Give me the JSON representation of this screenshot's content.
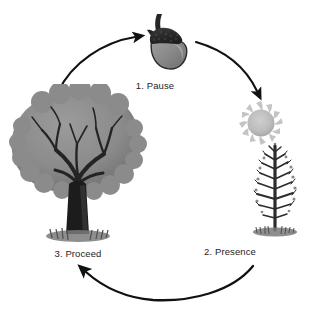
{
  "diagram": {
    "background_color": "#ffffff",
    "arrow_color": "#111111",
    "text_color": "#1d1d1d",
    "direction": "clockwise",
    "nodes": [
      {
        "id": "pause",
        "label": "1. Pause",
        "icon": "acorn-icon",
        "icon_description": "acorn with dark textured cap, stem and gray nut body",
        "colors": {
          "cap": "#2b2b2b",
          "nut": "#8a8a8a",
          "nut_highlight": "#b4b4b4",
          "stem": "#262626"
        }
      },
      {
        "id": "presence",
        "label": "2. Presence",
        "icon": "sun-and-sapling-icon",
        "icon_description": "gray sun with swirled rays above a bare young tree on grass",
        "colors": {
          "sun": "#b9b9b9",
          "sun_rays": "#c9c9c9",
          "tree": "#2a2a2a",
          "grass": "#6d6d6d"
        }
      },
      {
        "id": "proceed",
        "label": "3. Proceed",
        "icon": "mature-tree-icon",
        "icon_description": "large leafy tree with gray canopy, dark trunk and grass at base",
        "colors": {
          "canopy": "#8d8d8d",
          "canopy_shadow": "#6f6f6f",
          "trunk": "#1f1f1f",
          "grass": "#6d6d6d"
        }
      }
    ],
    "arrows": [
      {
        "id": "arrow-proceed-to-pause",
        "from": "proceed",
        "to": "pause"
      },
      {
        "id": "arrow-pause-to-presence",
        "from": "pause",
        "to": "presence"
      },
      {
        "id": "arrow-presence-to-proceed",
        "from": "presence",
        "to": "proceed"
      }
    ]
  }
}
